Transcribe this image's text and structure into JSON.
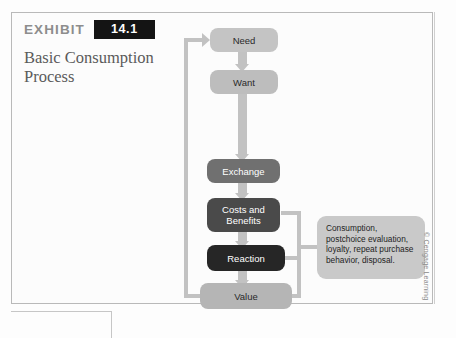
{
  "exhibit": {
    "label": "EXHIBIT",
    "number": "14.1",
    "title": "Basic Consumption\nProcess"
  },
  "diagram": {
    "boxes": [
      {
        "id": "need",
        "label": "Need",
        "fill": "#c4c4c4",
        "text_color": "#2a2a2a"
      },
      {
        "id": "want",
        "label": "Want",
        "fill": "#bdbdbd",
        "text_color": "#2a2a2a"
      },
      {
        "id": "exchange",
        "label": "Exchange",
        "fill": "#707070",
        "text_color": "#ffffff"
      },
      {
        "id": "costs-benefits",
        "label": "Costs and\nBenefits",
        "fill": "#4a4a4a",
        "text_color": "#ffffff"
      },
      {
        "id": "reaction",
        "label": "Reaction",
        "fill": "#262626",
        "text_color": "#ffffff"
      },
      {
        "id": "value",
        "label": "Value",
        "fill": "#b5b5b5",
        "text_color": "#2a2a2a"
      }
    ],
    "callout": "Consumption, postchoice evaluation, loyalty, repeat purchase behavior, disposal.",
    "connector_color": "#c2c2c2"
  },
  "copyright": "© Cengage Learning"
}
